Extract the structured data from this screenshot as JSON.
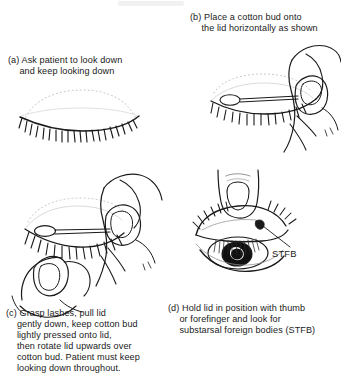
{
  "figure": {
    "background_color": "#ffffff",
    "ink_color": "#1a1a1a"
  },
  "panels": [
    {
      "id": "a",
      "label": "(a)",
      "caption_line_1": "Ask patient to look down",
      "caption_line_2": "and keep looking down",
      "illustration": "closed-eye-lashes"
    },
    {
      "id": "b",
      "label": "(b)",
      "caption_line_1": "Place a cotton bud onto",
      "caption_line_2": "the lid horizontally as shown",
      "illustration": "hand-holding-cotton-bud-on-lid"
    },
    {
      "id": "c",
      "label": "(c)",
      "caption_line_1": "Grasp lashes, pull lid",
      "caption_line_2": "gently down, keep cotton bud",
      "caption_line_3": "lightly pressed onto lid,",
      "caption_line_4": "then rotate lid upwards over",
      "caption_line_5": "cotton bud. Patient must keep",
      "caption_line_6": "looking down throughout.",
      "illustration": "two-hands-grasping-lashes-with-cotton-bud"
    },
    {
      "id": "d",
      "label": "(d)",
      "caption_line_1": "Hold lid in position with thumb",
      "caption_line_2": "or forefinger and look for",
      "caption_line_3": "substarsal foreign bodies (STFB)",
      "illustration": "everted-lid-thumb-holding"
    }
  ],
  "annotations": {
    "stfb_label": "STFB"
  }
}
